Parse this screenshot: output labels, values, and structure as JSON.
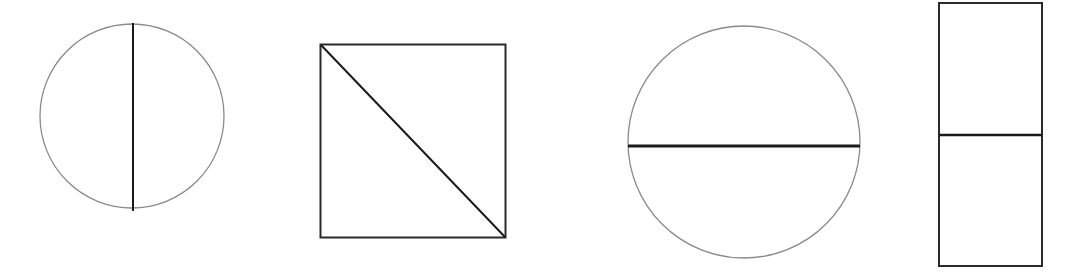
{
  "figure": {
    "colors": {
      "background": "#ffffff",
      "outline_circle": "#8a8a8a",
      "outline_rect": "#2a2a2a",
      "divider": "#1a1a1a"
    },
    "shapes": [
      {
        "id": "circle-vertical-diameter",
        "type": "circle",
        "divider": "vertical diameter"
      },
      {
        "id": "square-diagonal",
        "type": "square",
        "divider": "diagonal top-left to bottom-right"
      },
      {
        "id": "circle-horizontal-diameter",
        "type": "circle",
        "divider": "horizontal diameter"
      },
      {
        "id": "rectangle-horizontal-midline",
        "type": "rectangle",
        "divider": "horizontal midline"
      }
    ]
  }
}
